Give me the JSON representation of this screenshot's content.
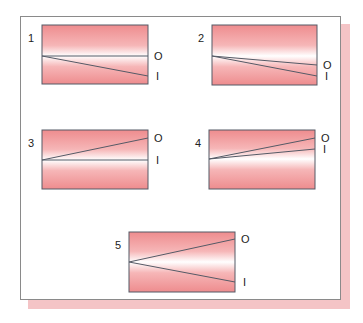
{
  "figure": {
    "panels": [
      {
        "number": "1",
        "box": {
          "x": 42,
          "y": 25,
          "w": 106,
          "h": 59
        },
        "origin_y": 56,
        "o_end_y": 56,
        "i_end_y": 76,
        "labels": {
          "o": "O",
          "i": "I"
        }
      },
      {
        "number": "2",
        "box": {
          "x": 212,
          "y": 25,
          "w": 105,
          "h": 60
        },
        "origin_y": 56,
        "o_end_y": 65,
        "i_end_y": 76,
        "labels": {
          "o": "O",
          "i": "I"
        }
      },
      {
        "number": "3",
        "box": {
          "x": 42,
          "y": 130,
          "w": 106,
          "h": 59
        },
        "origin_y": 160,
        "o_end_y": 138,
        "i_end_y": 160,
        "labels": {
          "o": "O",
          "i": "I"
        }
      },
      {
        "number": "4",
        "box": {
          "x": 209,
          "y": 130,
          "w": 106,
          "h": 59
        },
        "origin_y": 159,
        "o_end_y": 138,
        "i_end_y": 149,
        "labels": {
          "o": "O",
          "i": "I"
        }
      },
      {
        "number": "5",
        "box": {
          "x": 129,
          "y": 232,
          "w": 106,
          "h": 60
        },
        "origin_y": 262,
        "o_end_y": 239,
        "i_end_y": 282,
        "labels": {
          "o": "O",
          "i": "I"
        }
      }
    ],
    "colors": {
      "box_edge": "#ee8c8e",
      "box_center": "#ffffff",
      "line": "#555a66",
      "frame_border": "#8a8a8a",
      "shadow": "#f4c4c6"
    }
  }
}
